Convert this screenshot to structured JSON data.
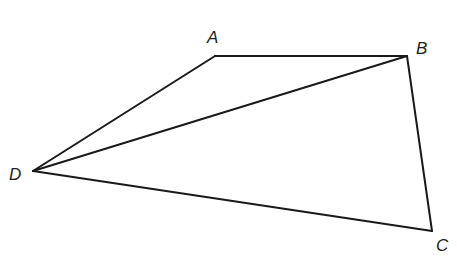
{
  "diagram": {
    "type": "quadrilateral-with-diagonal",
    "stroke_color": "#1a1a1a",
    "vertices": {
      "A": {
        "label": "A",
        "x": 215,
        "y": 56
      },
      "B": {
        "label": "B",
        "x": 407,
        "y": 56
      },
      "C": {
        "label": "C",
        "x": 432,
        "y": 231
      },
      "D": {
        "label": "D",
        "x": 33,
        "y": 171
      }
    },
    "edges": [
      {
        "from": "A",
        "to": "B"
      },
      {
        "from": "B",
        "to": "C"
      },
      {
        "from": "C",
        "to": "D"
      },
      {
        "from": "D",
        "to": "A"
      },
      {
        "from": "D",
        "to": "B"
      }
    ],
    "labels": {
      "A": "A",
      "B": "B",
      "C": "C",
      "D": "D"
    }
  }
}
